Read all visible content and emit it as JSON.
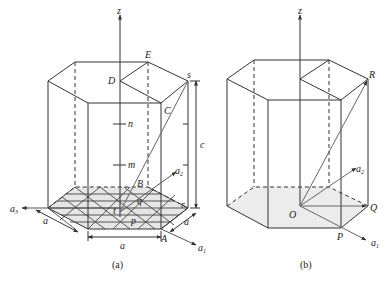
{
  "figure_a": {
    "caption": "(a)",
    "axis_z": "z",
    "vertices": {
      "E": "E",
      "D": "D",
      "s": "s",
      "C": "C",
      "B": "B",
      "r": "r",
      "A": "A",
      "p": "p",
      "q": "q",
      "t": "t"
    },
    "markers": {
      "n": "n",
      "m": "m"
    },
    "dimensions": {
      "c": "c",
      "a_bottom": "a",
      "a_left": "a",
      "a_right": "a"
    },
    "axes": {
      "a1": "a",
      "a1_sub": "1",
      "a2": "a",
      "a2_sub": "2",
      "a3": "a",
      "a3_sub": "3"
    }
  },
  "figure_b": {
    "caption": "(b)",
    "axis_z": "z",
    "vertices": {
      "R": "R",
      "O": "O",
      "P": "P",
      "Q": "Q"
    },
    "axes": {
      "a1": "a",
      "a1_sub": "1",
      "a2": "a",
      "a2_sub": "2"
    }
  }
}
